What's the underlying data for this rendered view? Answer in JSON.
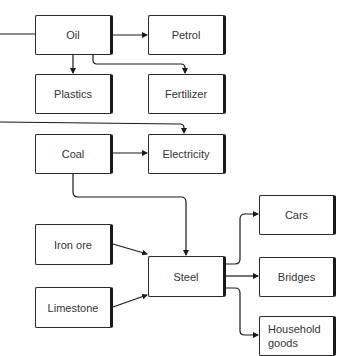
{
  "diagram": {
    "type": "flowchart",
    "nodes": {
      "oil": "Oil",
      "petrol": "Petrol",
      "plastics": "Plastics",
      "fertilizer": "Fertilizer",
      "coal": "Coal",
      "electricity": "Electricity",
      "iron_ore": "Iron ore",
      "limestone": "Limestone",
      "steel": "Steel",
      "cars": "Cars",
      "bridges": "Bridges",
      "household_goods_line1": "Household",
      "household_goods_line2": "goods"
    },
    "edges": [
      {
        "from": "Oil",
        "to": "Petrol"
      },
      {
        "from": "Oil",
        "to": "Plastics"
      },
      {
        "from": "Oil",
        "to": "Fertilizer"
      },
      {
        "from": "(offscreen left)",
        "to": "Oil"
      },
      {
        "from": "(offscreen left)",
        "to": "Electricity"
      },
      {
        "from": "Coal",
        "to": "Electricity"
      },
      {
        "from": "Coal",
        "to": "Steel"
      },
      {
        "from": "Iron ore",
        "to": "Steel"
      },
      {
        "from": "Limestone",
        "to": "Steel"
      },
      {
        "from": "Steel",
        "to": "Cars"
      },
      {
        "from": "Steel",
        "to": "Bridges"
      },
      {
        "from": "Steel",
        "to": "Household goods"
      }
    ]
  }
}
